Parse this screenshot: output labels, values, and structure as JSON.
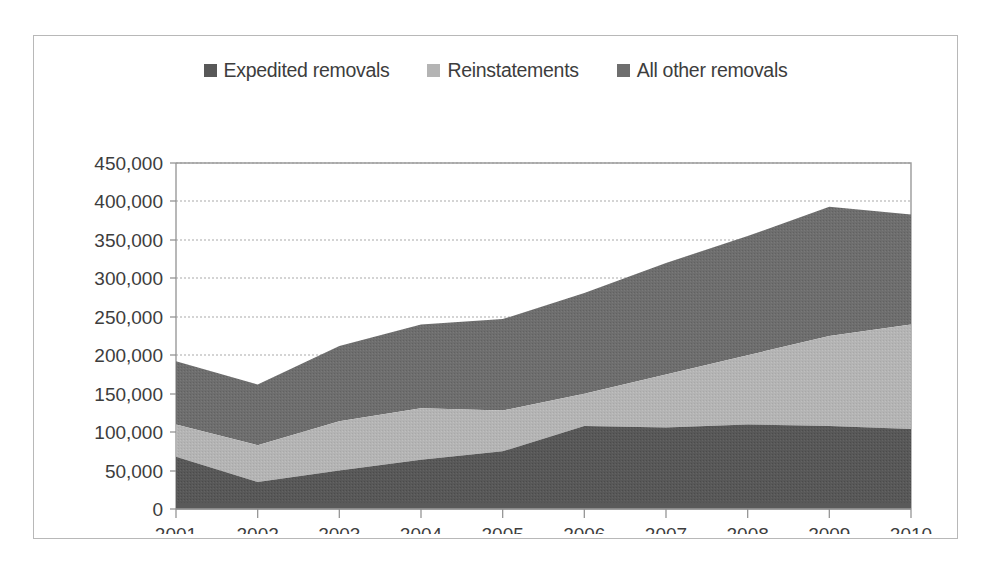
{
  "figure": {
    "background_color": "#ffffff",
    "border_color": "#b8b8b8"
  },
  "legend": {
    "position": "top-center",
    "entries": [
      {
        "label": "Expedited removals",
        "color": "#585858",
        "swatch_name": "legend-swatch-expedited-removals"
      },
      {
        "label": "Reinstatements",
        "color": "#b4b4b4",
        "swatch_name": "legend-swatch-reinstatements"
      },
      {
        "label": "All other removals",
        "color": "#6e6e6e",
        "swatch_name": "legend-swatch-all-other-removals"
      }
    ]
  },
  "axes": {
    "y_ticks": [
      "450,000",
      "400,000",
      "350,000",
      "300,000",
      "250,000",
      "200,000",
      "150,000",
      "100,000",
      "50,000",
      "0"
    ],
    "x_ticks": [
      "2001",
      "2002",
      "2003",
      "2004",
      "2005",
      "2006",
      "2007",
      "2008",
      "2009",
      "2010"
    ],
    "ylabel": "",
    "xlabel": "",
    "grid": "horizontal-dashed"
  },
  "chart_data": {
    "type": "area",
    "stacked": true,
    "title": "",
    "subtitle": "",
    "xlabel": "",
    "ylabel": "",
    "categories": [
      "2001",
      "2002",
      "2003",
      "2004",
      "2005",
      "2006",
      "2007",
      "2008",
      "2009",
      "2010"
    ],
    "x": [
      2001,
      2002,
      2003,
      2004,
      2005,
      2006,
      2007,
      2008,
      2009,
      2010
    ],
    "ylim": [
      0,
      450000
    ],
    "ytick_interval": 50000,
    "grid": true,
    "legend_position": "top-center",
    "series": [
      {
        "name": "Expedited removals",
        "color": "#585858",
        "values": [
          68000,
          35000,
          50000,
          64000,
          75000,
          108000,
          106000,
          110000,
          108000,
          104000
        ]
      },
      {
        "name": "Reinstatements",
        "color": "#b4b4b4",
        "values": [
          42000,
          48000,
          64000,
          67000,
          53000,
          42000,
          69000,
          90000,
          117000,
          136000
        ]
      },
      {
        "name": "All other removals",
        "color": "#6e6e6e",
        "values": [
          82000,
          79000,
          98000,
          109000,
          119000,
          131000,
          145000,
          155000,
          168000,
          143000
        ]
      }
    ],
    "cumulative_totals": [
      192000,
      162000,
      212000,
      240000,
      247000,
      281000,
      320000,
      355000,
      393000,
      383000
    ],
    "cumulative_expedited": [
      68000,
      35000,
      50000,
      64000,
      75000,
      108000,
      106000,
      110000,
      108000,
      104000
    ],
    "cumulative_expedited_plus_reinstatements": [
      110000,
      83000,
      114000,
      131000,
      128000,
      150000,
      175000,
      200000,
      225000,
      240000
    ]
  }
}
